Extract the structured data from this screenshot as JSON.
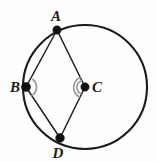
{
  "figure": {
    "kind": "circle-geometry-diagram",
    "background_color": "#fefefe",
    "width": 157,
    "height": 162,
    "circle": {
      "name": "main-circle",
      "center_x": 85,
      "center_y": 87,
      "radius": 62,
      "stroke_color": "#1b1b1b",
      "stroke_width": 2.1
    },
    "points": [
      {
        "id": "A",
        "label": "A",
        "x": 57,
        "y": 30,
        "label_x": 56,
        "label_y": 21,
        "on_circle": true,
        "dot_radius": 4.2
      },
      {
        "id": "B",
        "label": "B",
        "x": 26,
        "y": 87,
        "label_x": 15,
        "label_y": 92,
        "on_circle": true,
        "dot_radius": 4.6
      },
      {
        "id": "C",
        "label": "C",
        "x": 85,
        "y": 87,
        "label_x": 97,
        "label_y": 92,
        "on_circle": false,
        "dot_radius": 4.2
      },
      {
        "id": "D",
        "label": "D",
        "x": 60,
        "y": 138,
        "label_x": 58,
        "label_y": 158,
        "on_circle": true,
        "dot_radius": 4.4
      }
    ],
    "segments": [
      {
        "id": "AB",
        "from": "A",
        "to": "B",
        "stroke_color": "#1f1f1f",
        "stroke_width": 1.5
      },
      {
        "id": "AC",
        "from": "A",
        "to": "C",
        "stroke_color": "#1f1f1f",
        "stroke_width": 1.5
      },
      {
        "id": "BD",
        "from": "B",
        "to": "D",
        "stroke_color": "#1f1f1f",
        "stroke_width": 1.5
      },
      {
        "id": "CD",
        "from": "C",
        "to": "D",
        "stroke_color": "#1f1f1f",
        "stroke_width": 1.5
      }
    ],
    "angle_marks": [
      {
        "id": "angle-at-B",
        "vertex": "B",
        "opens_toward": "right",
        "radius": 10,
        "stroke_color": "#9a9a9a",
        "path": "M 32.8 79.5 A 10 10 0 0 1 32.0 95.6"
      },
      {
        "id": "angle-at-C",
        "vertex": "C",
        "opens_toward": "left",
        "radius": 11,
        "stroke_color": "#9a9a9a",
        "path": "M 80.5 77.2 A 11 11 0 0 0 79.4 97.0"
      },
      {
        "id": "angle-at-C-inner",
        "vertex": "C",
        "opens_toward": "left",
        "radius": 7,
        "stroke_color": "#9a9a9a",
        "path": "M 81.4 80.7 A 7 7 0 0 0 80.9 93.6"
      }
    ],
    "colors": {
      "stroke": "#1b1b1b",
      "chord": "#1f1f1f",
      "angle_mark": "#9a9a9a",
      "vertex": "#111111",
      "label": "#1a1a1a",
      "background": "#fefefe"
    }
  }
}
